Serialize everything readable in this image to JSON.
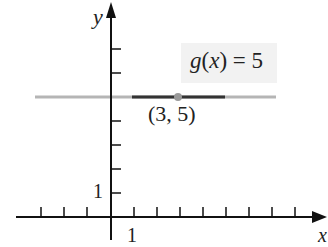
{
  "diagram": {
    "axes": {
      "x_label": "x",
      "y_label": "y",
      "x_unit_label": "1",
      "y_unit_label": "1"
    },
    "function_label": {
      "name": "g",
      "var": "x",
      "text_eq": "= 5"
    },
    "point": {
      "label": "(3, 5)",
      "x": 3,
      "y": 5
    },
    "colors": {
      "axis": "#111111",
      "line_light": "#b5b5b5",
      "line_dark": "#333333",
      "point": "#9a9a9a",
      "box": "#f2f2f2"
    }
  }
}
